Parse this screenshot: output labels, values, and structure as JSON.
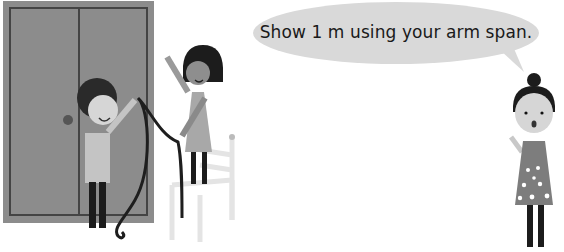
{
  "speech_bubble": {
    "text": "Show 1 m using your arm span."
  },
  "scene": {
    "description": "Two children measuring a wardrobe door with a rope while a teacher speaks",
    "colors": {
      "wardrobe": "#8a8a8a",
      "wardrobe_frame": "#4a4a4a",
      "bubble": "#d9d9d9",
      "chair": "#e6e6e6",
      "dark": "#1c1c1c"
    }
  }
}
